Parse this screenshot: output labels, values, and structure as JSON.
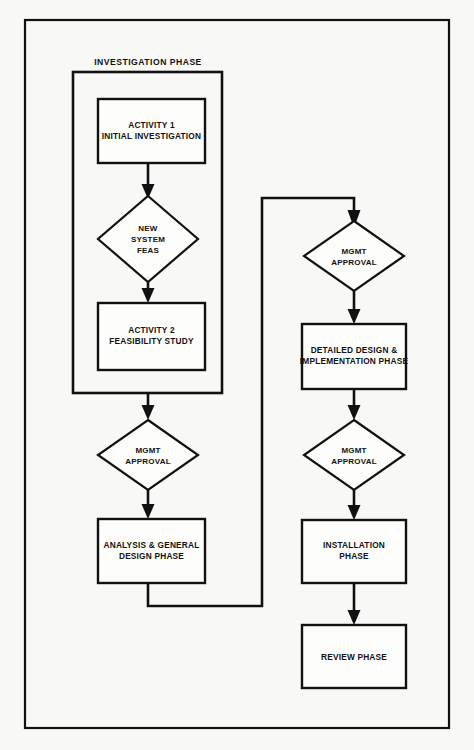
{
  "diagram": {
    "type": "flowchart",
    "title_visible": false,
    "background_color": "#f8f8f6",
    "line_color": "#111111",
    "phase_container": {
      "label": "INVESTIGATION PHASE",
      "x": 73,
      "y": 72,
      "w": 149,
      "h": 321
    },
    "nodes": [
      {
        "id": "activity1",
        "shape": "rect",
        "lines": [
          "ACTIVITY 1",
          "INITIAL INVESTIGATION"
        ],
        "x": 98,
        "y": 99,
        "w": 107,
        "h": 64
      },
      {
        "id": "new-system-feas",
        "shape": "diamond",
        "lines": [
          "NEW",
          "SYSTEM",
          "FEAS"
        ],
        "cx": 148,
        "cy": 239,
        "rx": 50,
        "ry": 43
      },
      {
        "id": "activity2",
        "shape": "rect",
        "lines": [
          "ACTIVITY 2",
          "FEASIBILITY STUDY"
        ],
        "x": 98,
        "y": 303,
        "w": 107,
        "h": 67
      },
      {
        "id": "mgmt-approval-1",
        "shape": "diamond",
        "lines": [
          "MGMT",
          "APPROVAL"
        ],
        "cx": 148,
        "cy": 455,
        "rx": 50,
        "ry": 35
      },
      {
        "id": "analysis-general-design",
        "shape": "rect",
        "lines": [
          "ANALYSIS & GENERAL",
          "DESIGN PHASE"
        ],
        "x": 98,
        "y": 519,
        "w": 107,
        "h": 64
      },
      {
        "id": "mgmt-approval-2",
        "shape": "diamond",
        "lines": [
          "MGMT",
          "APPROVAL"
        ],
        "cx": 354,
        "cy": 256,
        "rx": 50,
        "ry": 35
      },
      {
        "id": "detailed-design-implementation",
        "shape": "rect",
        "lines": [
          "DETAILED DESIGN &",
          "IMPLEMENTATION PHASE"
        ],
        "x": 302,
        "y": 324,
        "w": 104,
        "h": 65
      },
      {
        "id": "mgmt-approval-3",
        "shape": "diamond",
        "lines": [
          "MGMT",
          "APPROVAL"
        ],
        "cx": 354,
        "cy": 455,
        "rx": 50,
        "ry": 35
      },
      {
        "id": "installation-phase",
        "shape": "rect",
        "lines": [
          "INSTALLATION",
          "PHASE"
        ],
        "x": 302,
        "y": 520,
        "w": 104,
        "h": 63
      },
      {
        "id": "review-phase",
        "shape": "rect",
        "lines": [
          "REVIEW PHASE"
        ],
        "x": 302,
        "y": 625,
        "w": 104,
        "h": 63
      }
    ],
    "connectors": [
      {
        "id": "activity1-to-feas",
        "from": "activity1",
        "to": "new-system-feas",
        "kind": "straight-down"
      },
      {
        "id": "feas-to-activity2",
        "from": "new-system-feas",
        "to": "activity2",
        "kind": "straight-down"
      },
      {
        "id": "phase-to-mgmt1",
        "from": "phase_container",
        "to": "mgmt-approval-1",
        "kind": "straight-down"
      },
      {
        "id": "mgmt1-to-analysis",
        "from": "mgmt-approval-1",
        "to": "analysis-general-design",
        "kind": "straight-down"
      },
      {
        "id": "analysis-to-mgmt2",
        "from": "analysis-general-design",
        "to": "mgmt-approval-2",
        "kind": "elbow-up-right"
      },
      {
        "id": "mgmt2-to-detailed",
        "from": "mgmt-approval-2",
        "to": "detailed-design-implementation",
        "kind": "straight-down"
      },
      {
        "id": "detailed-to-mgmt3",
        "from": "detailed-design-implementation",
        "to": "mgmt-approval-3",
        "kind": "straight-down"
      },
      {
        "id": "mgmt3-to-installation",
        "from": "mgmt-approval-3",
        "to": "installation-phase",
        "kind": "straight-down"
      },
      {
        "id": "installation-to-review",
        "from": "installation-phase",
        "to": "review-phase",
        "kind": "straight-down"
      }
    ],
    "outer_frame": {
      "x": 25,
      "y": 20,
      "w": 424,
      "h": 708
    }
  }
}
